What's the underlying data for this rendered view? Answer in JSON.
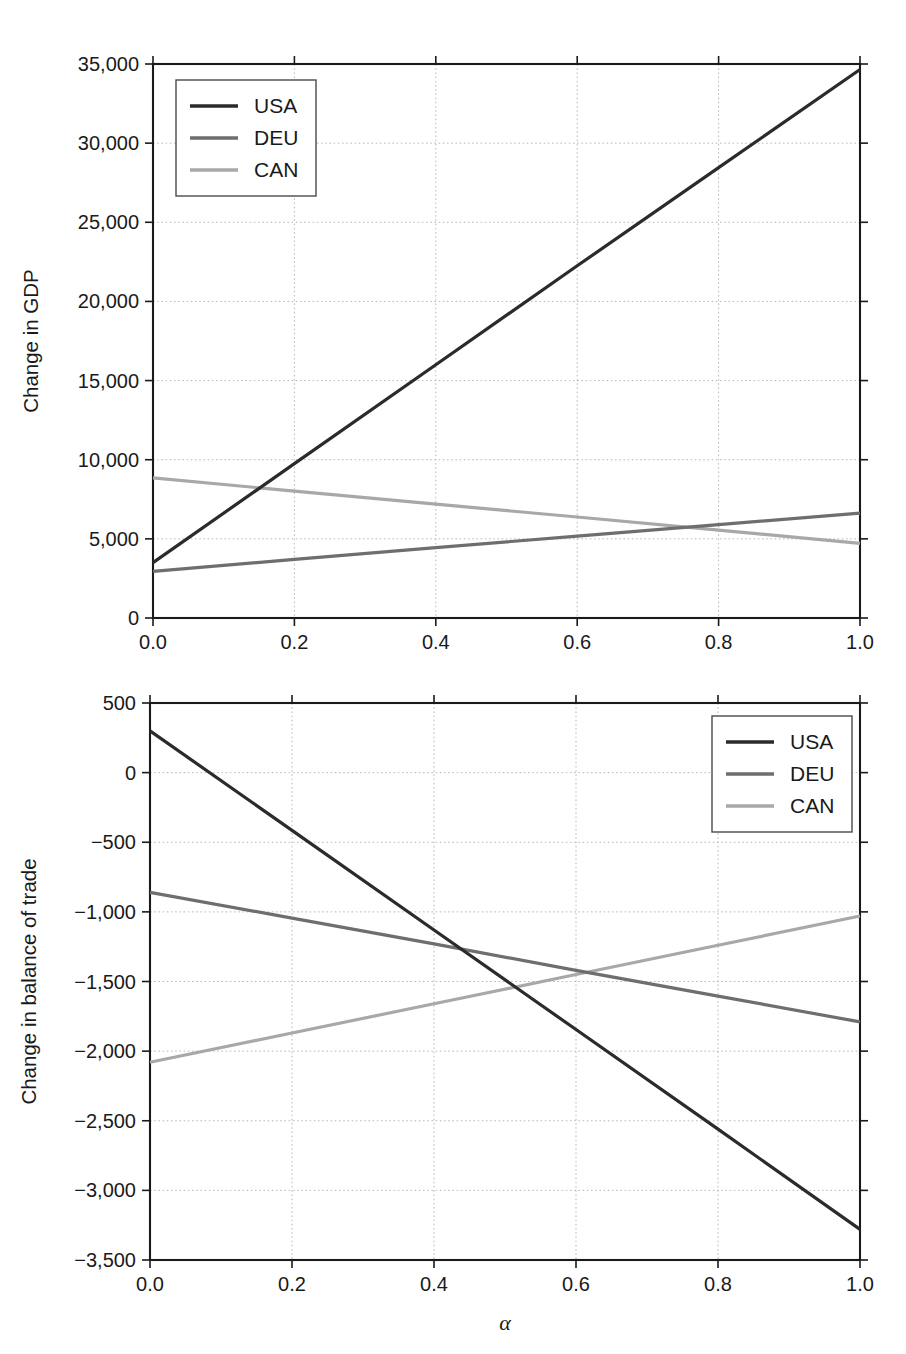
{
  "figures": [
    {
      "id": "gdp",
      "name": "change-in-gdp-chart",
      "chart_data": {
        "type": "line",
        "title": "",
        "xlabel": "α",
        "ylabel": "Change in GDP",
        "xlim": [
          0.0,
          1.0
        ],
        "ylim": [
          0,
          35000
        ],
        "xticks": [
          0.0,
          0.2,
          0.4,
          0.6,
          0.8,
          1.0
        ],
        "xticklabels": [
          "0.0",
          "0.2",
          "0.4",
          "0.6",
          "0.8",
          "1.0"
        ],
        "yticks": [
          0,
          5000,
          10000,
          15000,
          20000,
          25000,
          30000,
          35000
        ],
        "yticklabels": [
          "0",
          "5,000",
          "10,000",
          "15,000",
          "20,000",
          "25,000",
          "30,000",
          "35,000"
        ],
        "grid": true,
        "legend_position": "upper left",
        "x": [
          0.0,
          0.2,
          0.4,
          0.6,
          0.8,
          1.0
        ],
        "series": [
          {
            "name": "USA",
            "color": "#2b2b2b",
            "values": [
              3500,
              9750,
              16000,
              22250,
              28450,
              34650
            ]
          },
          {
            "name": "DEU",
            "color": "#6e6e6e",
            "values": [
              2950,
              3700,
              4450,
              5170,
              5900,
              6620
            ]
          },
          {
            "name": "CAN",
            "color": "#a8a8a8",
            "values": [
              8850,
              8020,
              7190,
              6380,
              5550,
              4720
            ]
          }
        ]
      }
    },
    {
      "id": "trade",
      "name": "change-in-balance-of-trade-chart",
      "chart_data": {
        "type": "line",
        "title": "",
        "xlabel": "α",
        "ylabel": "Change in balance of trade",
        "xlim": [
          0.0,
          1.0
        ],
        "ylim": [
          -3500,
          500
        ],
        "xticks": [
          0.0,
          0.2,
          0.4,
          0.6,
          0.8,
          1.0
        ],
        "xticklabels": [
          "0.0",
          "0.2",
          "0.4",
          "0.6",
          "0.8",
          "1.0"
        ],
        "yticks": [
          -3500,
          -3000,
          -2500,
          -2000,
          -1500,
          -1000,
          -500,
          0,
          500
        ],
        "yticklabels": [
          "−3,500",
          "−3,000",
          "−2,500",
          "−2,000",
          "−1,500",
          "−1,000",
          "−500",
          "0",
          "500"
        ],
        "grid": true,
        "legend_position": "upper right",
        "x": [
          0.0,
          0.2,
          0.4,
          0.6,
          0.8,
          1.0
        ],
        "series": [
          {
            "name": "USA",
            "color": "#2b2b2b",
            "values": [
              300,
              -415,
              -1130,
              -1845,
              -2560,
              -3280
            ]
          },
          {
            "name": "DEU",
            "color": "#6e6e6e",
            "values": [
              -860,
              -1045,
              -1230,
              -1420,
              -1605,
              -1790
            ]
          },
          {
            "name": "CAN",
            "color": "#a8a8a8",
            "values": [
              -2080,
              -1870,
              -1660,
              -1450,
              -1240,
              -1030
            ]
          }
        ]
      }
    }
  ]
}
